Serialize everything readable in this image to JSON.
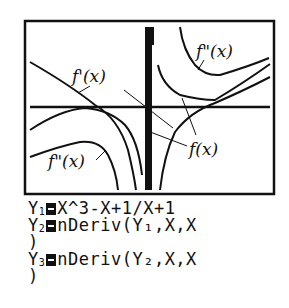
{
  "graph": {
    "labels": {
      "fpp_top": "f\"(x)",
      "fp": "f'(x)",
      "f": "f(x)",
      "fpp_bottom": "f\"(x)"
    },
    "colors": {
      "ink": "#111111",
      "background": "#ffffff"
    }
  },
  "equations": [
    {
      "name": "Y",
      "index": "1",
      "expr": "X^3-X+1/X+1",
      "cont": ""
    },
    {
      "name": "Y",
      "index": "2",
      "expr": "nDeriv(Y₁,X,X",
      "cont": ")"
    },
    {
      "name": "Y",
      "index": "3",
      "expr": "nDeriv(Y₂,X,X",
      "cont": ")"
    }
  ]
}
